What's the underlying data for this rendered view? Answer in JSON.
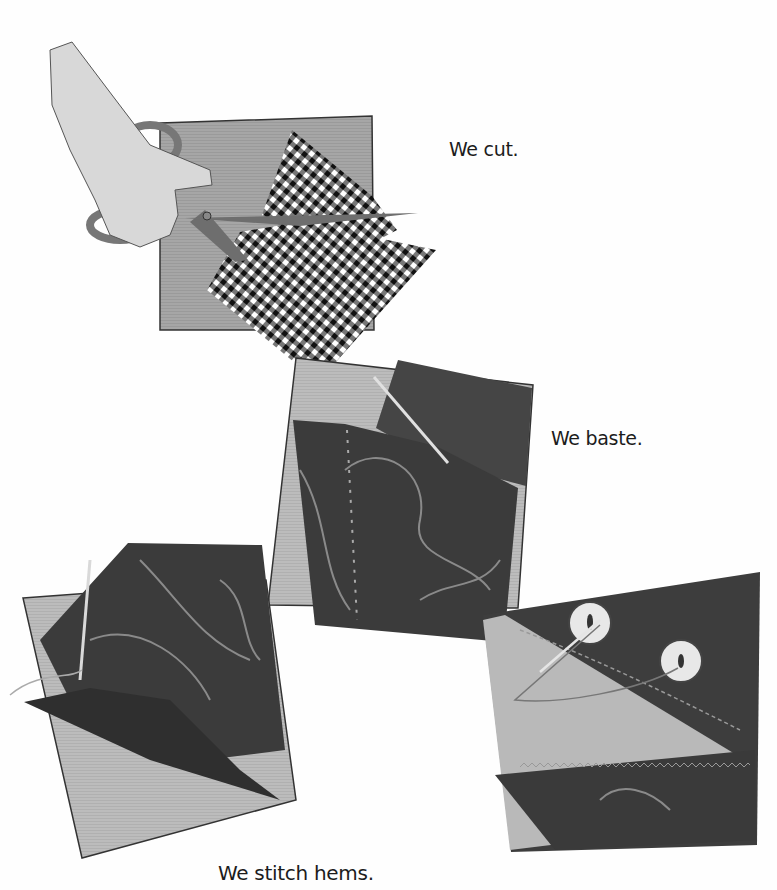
{
  "page": {
    "background": "#fefefe"
  },
  "captions": {
    "cut": "We cut.",
    "baste": "We baste.",
    "stitch": "We stitch hems."
  },
  "illustrations": [
    {
      "id": "cutting",
      "elements": [
        "hand",
        "scissors",
        "gray-fabric-square",
        "gingham-fabric"
      ]
    },
    {
      "id": "basting",
      "elements": [
        "gray-fabric-square",
        "paisley-fabric",
        "needle",
        "basting-stitches"
      ]
    },
    {
      "id": "hemming",
      "elements": [
        "gray-fabric-square",
        "paisley-fabric-curved",
        "needle",
        "thread"
      ]
    },
    {
      "id": "buttons",
      "elements": [
        "gray-fabric-triangle",
        "paisley-fabric",
        "button-1",
        "button-2",
        "zigzag-stitch",
        "thread"
      ]
    }
  ],
  "colors": {
    "gray_fabric": "#a9a9a9",
    "light_gray_fabric": "#bdbdbd",
    "dark_paisley": "#3d3d3d",
    "paisley_line": "#8a8a8a",
    "skin": "#dcdcdc",
    "scissors": "#7a7a7a",
    "button": "#e6e6e6"
  }
}
